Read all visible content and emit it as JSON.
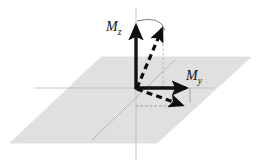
{
  "figure": {
    "background_color": "#ffffff"
  },
  "colors": {
    "plane_fill": "#e3e3e3",
    "plane_stroke": "#dcdcdc",
    "axis_gray": "#b4b4b4",
    "projection_gray": "#a8a8a8",
    "vector_black": "#111111",
    "dashed_black": "#0d0d0d",
    "arc_gray": "#6e6e6e"
  },
  "plane": {
    "name": "xy-plane",
    "shape": "parallelogram",
    "points": [
      [
        101,
        57
      ],
      [
        251,
        57
      ],
      [
        157,
        143
      ],
      [
        10,
        143
      ]
    ]
  },
  "axes": [
    {
      "name": "z-axis",
      "orientation": "vertical",
      "from": [
        136,
        8
      ],
      "to": [
        136,
        160
      ]
    },
    {
      "name": "y-axis",
      "orientation": "horizontal",
      "from": [
        35,
        88
      ],
      "to": [
        215,
        88
      ]
    },
    {
      "name": "x-axis",
      "orientation": "diagonal",
      "from": [
        92,
        140
      ],
      "to": [
        175,
        60
      ]
    }
  ],
  "vectors": [
    {
      "name": "mz-vector",
      "style": "solid",
      "label": "M",
      "subscript": "z",
      "from": [
        136,
        88
      ],
      "to": [
        136,
        22
      ]
    },
    {
      "name": "my-vector",
      "style": "solid",
      "label": "M",
      "subscript": "y",
      "from": [
        136,
        88
      ],
      "to": [
        190,
        88
      ]
    },
    {
      "name": "tilted-upper-vector",
      "style": "dashed",
      "from": [
        136,
        88
      ],
      "to": [
        163,
        26
      ]
    },
    {
      "name": "tilted-lower-vector",
      "style": "dashed",
      "from": [
        136,
        88
      ],
      "to": [
        186,
        106
      ]
    }
  ],
  "projections": [
    {
      "name": "vertical-projection-line",
      "style": "dashed",
      "from": [
        163,
        30
      ],
      "to": [
        163,
        88
      ]
    },
    {
      "name": "horizontal-projection-line",
      "style": "dashed",
      "from": [
        136,
        106
      ],
      "to": [
        186,
        106
      ]
    },
    {
      "name": "my-tip-drop-line",
      "style": "solid-thin",
      "from": [
        190,
        88
      ],
      "to": [
        190,
        103
      ]
    }
  ],
  "arc": {
    "name": "rotation-arc",
    "from": [
      136,
      22
    ],
    "to": [
      164,
      29
    ],
    "description": "thin arc linking the Mz arrow tip to the tilted dashed arrow tip"
  },
  "labels": {
    "mz": {
      "base": "M",
      "subscript": "z",
      "x": 106,
      "y": 30
    },
    "my": {
      "base": "M",
      "subscript": "y",
      "x": 186,
      "y": 80
    }
  }
}
